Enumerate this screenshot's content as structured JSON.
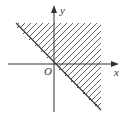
{
  "figure": {
    "type": "inequality-region",
    "axes": {
      "x_label": "x",
      "y_label": "y",
      "origin_label": "O"
    },
    "boundary": {
      "equation": "y = -x",
      "style": "solid with small tick marks toward the unshaded side"
    },
    "shaded_region": "x + y >= 0",
    "colors": {
      "line": "#333333",
      "hatch": "#555555",
      "background": "#ffffff"
    }
  }
}
